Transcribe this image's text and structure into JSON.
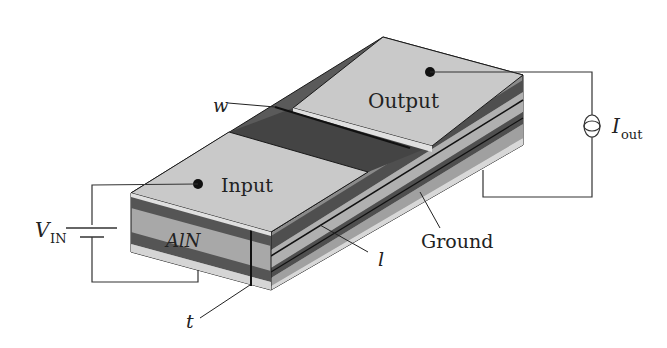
{
  "labels": {
    "output": "Output",
    "input": "Input",
    "w": "w",
    "aln": "AlN",
    "ground": "Ground",
    "l": "l",
    "t": "t",
    "vin_main": "V",
    "vin_sub": "IN",
    "iout_main": "I",
    "iout_sub": "out"
  },
  "colors": {
    "electrode": "#c8c8c8",
    "dark_layer": "#5a5a5a",
    "channel": "#4a4a4a",
    "aln": "#a8a8a8",
    "edge": "#1a1a1a",
    "wire": "#333333"
  }
}
